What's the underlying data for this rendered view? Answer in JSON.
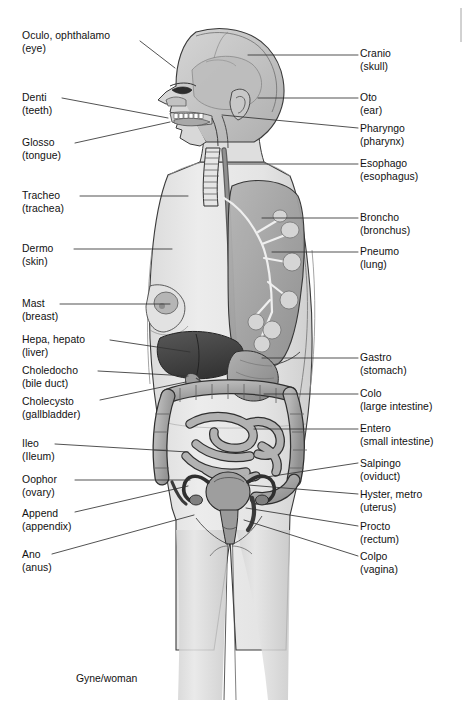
{
  "figure": {
    "title": "Gyne/woman",
    "caption": "Gyne/woman",
    "background_color": "#ffffff",
    "body_fill": "#e8e8e8",
    "organ_dark": "#4a4a4a",
    "organ_mid": "#9a9a9a",
    "organ_light": "#c4c4c4",
    "outline_color": "#2b2b2b",
    "leader_color": "#333333"
  },
  "labels_left": [
    {
      "id": "oculo",
      "term": "Oculo, ophthalamo",
      "english": "(eye)",
      "x": 22,
      "y": 30,
      "leader": [
        [
          140,
          41
        ],
        [
          175,
          68
        ]
      ]
    },
    {
      "id": "denti",
      "term": "Denti",
      "english": "(teeth)",
      "x": 22,
      "y": 92,
      "leader": [
        [
          62,
          98
        ],
        [
          168,
          118
        ]
      ]
    },
    {
      "id": "glosso",
      "term": "Glosso",
      "english": "(tongue)",
      "x": 22,
      "y": 137,
      "leader": [
        [
          75,
          143
        ],
        [
          170,
          122
        ]
      ]
    },
    {
      "id": "tracheo",
      "term": "Tracheo",
      "english": "(trachea)",
      "x": 22,
      "y": 190,
      "leader": [
        [
          80,
          196
        ],
        [
          188,
          196
        ]
      ]
    },
    {
      "id": "dermo",
      "term": "Dermo",
      "english": "(skin)",
      "x": 22,
      "y": 243,
      "leader": [
        [
          74,
          249
        ],
        [
          172,
          249
        ]
      ]
    },
    {
      "id": "mast",
      "term": "Mast",
      "english": "(breast)",
      "x": 22,
      "y": 298,
      "leader": [
        [
          60,
          304
        ],
        [
          170,
          304
        ]
      ]
    },
    {
      "id": "hepa",
      "term": "Hepa, hepato",
      "english": "(liver)",
      "x": 22,
      "y": 334,
      "leader": [
        [
          110,
          340
        ],
        [
          190,
          352
        ]
      ]
    },
    {
      "id": "choledocho",
      "term": "Choledocho",
      "english": "(bile duct)",
      "x": 22,
      "y": 365,
      "leader": [
        [
          98,
          371
        ],
        [
          188,
          376
        ]
      ]
    },
    {
      "id": "cholecysto",
      "term": "Cholecysto",
      "english": "(gallbladder)",
      "x": 22,
      "y": 396,
      "leader": [
        [
          100,
          400
        ],
        [
          186,
          382
        ]
      ]
    },
    {
      "id": "ileo",
      "term": "Ileo",
      "english": "(Ileum)",
      "x": 22,
      "y": 438,
      "leader": [
        [
          55,
          444
        ],
        [
          188,
          452
        ]
      ]
    },
    {
      "id": "oophor",
      "term": "Oophor",
      "english": "(ovary)",
      "x": 22,
      "y": 474,
      "leader": [
        [
          75,
          480
        ],
        [
          190,
          480
        ]
      ]
    },
    {
      "id": "append",
      "term": "Append",
      "english": "(appendix)",
      "x": 22,
      "y": 508,
      "leader": [
        [
          75,
          512
        ],
        [
          188,
          486
        ]
      ]
    },
    {
      "id": "ano",
      "term": "Ano",
      "english": "(anus)",
      "x": 22,
      "y": 549,
      "leader": [
        [
          52,
          554
        ],
        [
          194,
          515
        ]
      ]
    }
  ],
  "labels_right": [
    {
      "id": "cranio",
      "term": "Cranio",
      "english": "(skull)",
      "x": 360,
      "y": 48,
      "leader": [
        [
          358,
          55
        ],
        [
          248,
          55
        ]
      ]
    },
    {
      "id": "oto",
      "term": "Oto",
      "english": "(ear)",
      "x": 360,
      "y": 92,
      "leader": [
        [
          358,
          98
        ],
        [
          258,
          98
        ]
      ]
    },
    {
      "id": "pharyngo",
      "term": "Pharyngo",
      "english": "(pharynx)",
      "x": 360,
      "y": 123,
      "leader": [
        [
          358,
          128
        ],
        [
          222,
          115
        ]
      ]
    },
    {
      "id": "esophago",
      "term": "Esophago",
      "english": "(esophagus)",
      "x": 360,
      "y": 158,
      "leader": [
        [
          358,
          164
        ],
        [
          228,
          164
        ]
      ]
    },
    {
      "id": "broncho",
      "term": "Broncho",
      "english": "(bronchus)",
      "x": 360,
      "y": 212,
      "leader": [
        [
          358,
          218
        ],
        [
          262,
          218
        ]
      ]
    },
    {
      "id": "pneumo",
      "term": "Pneumo",
      "english": "(lung)",
      "x": 360,
      "y": 246,
      "leader": [
        [
          358,
          252
        ],
        [
          272,
          252
        ]
      ]
    },
    {
      "id": "gastro",
      "term": "Gastro",
      "english": "(stomach)",
      "x": 360,
      "y": 352,
      "leader": [
        [
          358,
          358
        ],
        [
          262,
          358
        ]
      ]
    },
    {
      "id": "colo",
      "term": "Colo",
      "english": "(large intestine)",
      "x": 360,
      "y": 388,
      "leader": [
        [
          358,
          394
        ],
        [
          264,
          394
        ]
      ]
    },
    {
      "id": "entero",
      "term": "Entero",
      "english": "(small intestine)",
      "x": 360,
      "y": 423,
      "leader": [
        [
          358,
          429
        ],
        [
          254,
          429
        ]
      ]
    },
    {
      "id": "salpingo",
      "term": "Salpingo",
      "english": "(oviduct)",
      "x": 360,
      "y": 458,
      "leader": [
        [
          358,
          463
        ],
        [
          260,
          478
        ]
      ]
    },
    {
      "id": "hyster",
      "term": "Hyster, metro",
      "english": "(uterus)",
      "x": 360,
      "y": 489,
      "leader": [
        [
          358,
          494
        ],
        [
          248,
          485
        ]
      ]
    },
    {
      "id": "procto",
      "term": "Procto",
      "english": "(rectum)",
      "x": 360,
      "y": 521,
      "leader": [
        [
          358,
          526
        ],
        [
          246,
          508
        ]
      ]
    },
    {
      "id": "colpo",
      "term": "Colpo",
      "english": "(vagina)",
      "x": 360,
      "y": 551,
      "leader": [
        [
          358,
          556
        ],
        [
          244,
          520
        ]
      ]
    }
  ]
}
